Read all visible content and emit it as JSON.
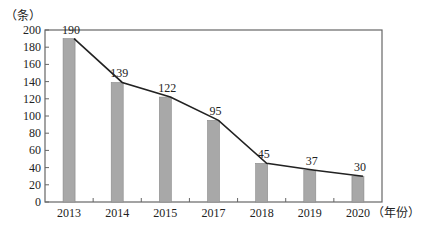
{
  "chart_data": {
    "type": "bar",
    "title": "",
    "ylabel": "（条）",
    "xlabel": "（年份）",
    "categories": [
      "2013",
      "2014",
      "2015",
      "2017",
      "2018",
      "2019",
      "2020"
    ],
    "values": [
      190,
      139,
      122,
      95,
      45,
      37,
      30
    ],
    "series": [
      {
        "name": "bars",
        "type": "bar",
        "values": [
          190,
          139,
          122,
          95,
          45,
          37,
          30
        ]
      },
      {
        "name": "line",
        "type": "line",
        "values": [
          190,
          139,
          122,
          95,
          45,
          37,
          30
        ]
      }
    ],
    "data_labels": [
      "190",
      "139",
      "122",
      "95",
      "45",
      "37",
      "30"
    ],
    "ylim": [
      0,
      200
    ],
    "yticks": [
      0,
      20,
      40,
      60,
      80,
      100,
      120,
      140,
      160,
      180,
      200
    ],
    "grid": false,
    "legend": "none",
    "colors": {
      "bar": "#a8a8a8",
      "line": "#222222",
      "axis": "#666666"
    }
  }
}
